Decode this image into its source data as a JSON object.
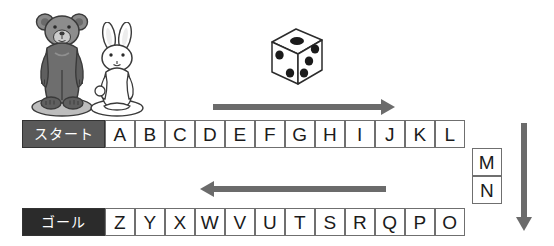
{
  "board": {
    "start_label": "スタート",
    "goal_label": "ゴール",
    "top_row": [
      "A",
      "B",
      "C",
      "D",
      "E",
      "F",
      "G",
      "H",
      "I",
      "J",
      "K",
      "L"
    ],
    "right_column": [
      "M",
      "N"
    ],
    "bottom_row": [
      "Z",
      "Y",
      "X",
      "W",
      "V",
      "U",
      "T",
      "S",
      "R",
      "Q",
      "P",
      "O"
    ],
    "colors": {
      "start_bg": "#595959",
      "goal_bg": "#2b2b2b",
      "cell_border": "#6f6f6f",
      "arrow": "#6b6b6b",
      "bear": "#6e6e6e",
      "rabbit": "#ffffff"
    }
  },
  "pieces": {
    "bear_name": "bear-token",
    "rabbit_name": "rabbit-token"
  },
  "die": {
    "name": "dice",
    "top_face_pips": 1,
    "left_face_pips": 2,
    "right_face_pips": 3
  },
  "arrows": {
    "top": "right",
    "bottom": "left",
    "right": "down"
  }
}
